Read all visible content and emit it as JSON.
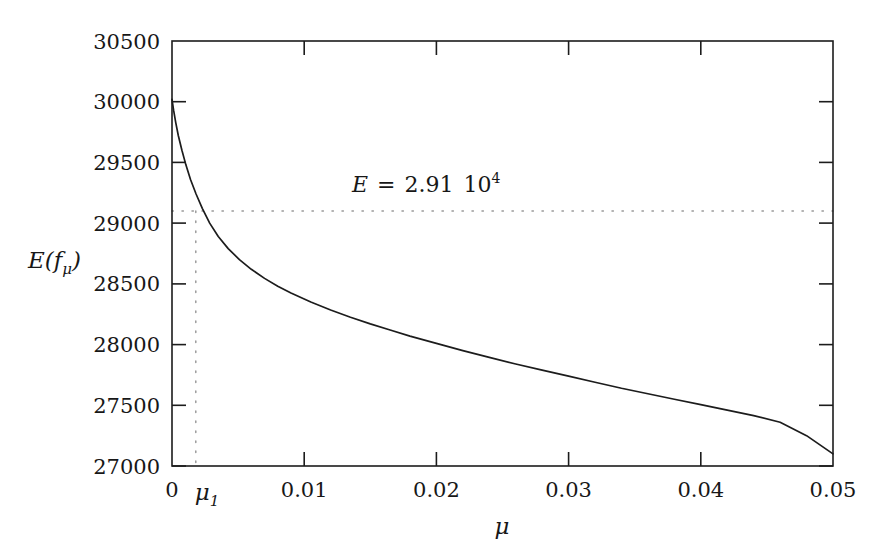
{
  "chart_data": {
    "type": "line",
    "title": "",
    "xlabel": "μ",
    "ylabel": "E(fμ)",
    "xlim": [
      0,
      0.05
    ],
    "ylim": [
      27000,
      30500
    ],
    "grid": false,
    "legend": "none",
    "xticks": [
      0,
      0.01,
      0.02,
      0.03,
      0.04,
      0.05
    ],
    "xticklabels": [
      "0",
      "0.01",
      "0.02",
      "0.03",
      "0.04",
      "0.05"
    ],
    "yticks": [
      27000,
      27500,
      28000,
      28500,
      29000,
      29500,
      30000,
      30500
    ],
    "yticklabels": [
      "27000",
      "27500",
      "28000",
      "28500",
      "29000",
      "29500",
      "30000",
      "30500"
    ],
    "series": [
      {
        "name": "E(f_mu)",
        "x": [
          0.0,
          0.00012,
          0.00028,
          0.00048,
          0.00075,
          0.00105,
          0.0014,
          0.00182,
          0.0023,
          0.00285,
          0.0035,
          0.00425,
          0.0051,
          0.006,
          0.007,
          0.008,
          0.009,
          0.0105,
          0.012,
          0.0135,
          0.015,
          0.0165,
          0.018,
          0.02,
          0.022,
          0.024,
          0.026,
          0.028,
          0.03,
          0.032,
          0.034,
          0.036,
          0.038,
          0.04,
          0.042,
          0.044,
          0.046,
          0.048,
          0.05
        ],
        "y": [
          30020,
          29930,
          29830,
          29720,
          29600,
          29480,
          29360,
          29240,
          29120,
          29000,
          28890,
          28790,
          28700,
          28620,
          28545,
          28480,
          28425,
          28350,
          28285,
          28225,
          28170,
          28120,
          28070,
          28010,
          27950,
          27895,
          27840,
          27790,
          27740,
          27690,
          27640,
          27595,
          27550,
          27505,
          27460,
          27415,
          27360,
          27250,
          27100
        ]
      }
    ],
    "annotations": [
      {
        "name": "energy-level-label",
        "text": "E = 2.91 10^4",
        "text_parts": {
          "symbol": "E",
          "equals": "=",
          "mantissa": "2.91",
          "base": "10",
          "exponent": "4"
        },
        "x": 0.0195,
        "y": 29440
      },
      {
        "name": "mu1-tick-label",
        "text": "μ1",
        "text_parts": {
          "symbol": "μ",
          "subscript": "1"
        },
        "x": 0.0018,
        "y": 27000
      }
    ],
    "reference_lines": [
      {
        "name": "horizontal-energy-guide",
        "orientation": "horizontal",
        "value": 29100,
        "style": "dotted"
      },
      {
        "name": "vertical-mu1-guide",
        "orientation": "vertical",
        "value": 0.0018,
        "style": "dotted"
      }
    ],
    "colors": {
      "curve": "#1c1c1c",
      "frame": "#1c1c1c",
      "guide": "#9a9a9a",
      "text": "#171717",
      "background": "#ffffff"
    }
  },
  "ylabels": {
    "t0": "27000",
    "t1": "27500",
    "t2": "28000",
    "t3": "28500",
    "t4": "29000",
    "t5": "29500",
    "t6": "30000",
    "t7": "30500"
  },
  "xlabels": {
    "t0": "0",
    "t1": "0.01",
    "t2": "0.02",
    "t3": "0.03",
    "t4": "0.04",
    "t5": "0.05"
  },
  "axis": {
    "y_title_main": "E",
    "y_title_paren_open": "(",
    "y_title_f": "f",
    "y_title_sub": "μ",
    "y_title_paren_close": ")",
    "x_title": "μ"
  },
  "annotation": {
    "symbol": "E",
    "equals": "=",
    "mantissa": "2.91",
    "base": "10",
    "exponent": "4"
  },
  "mu1": {
    "symbol": "μ",
    "subscript": "1"
  }
}
